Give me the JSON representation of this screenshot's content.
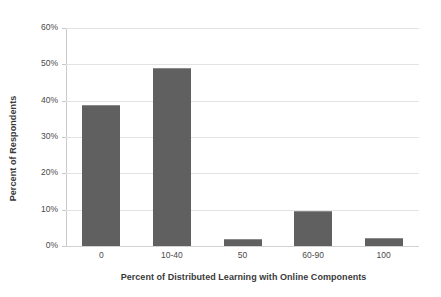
{
  "chart_data": {
    "type": "bar",
    "title": "",
    "categories": [
      "0",
      "10-40",
      "50",
      "60-90",
      "100"
    ],
    "values": [
      38.8,
      49.0,
      2.0,
      9.7,
      2.3
    ],
    "xlabel": "Percent of Distributed Learning with Online Components",
    "ylabel": "Percent of Respondents",
    "ylim": [
      0,
      60
    ],
    "ytick_labels": [
      "0%",
      "10%",
      "20%",
      "30%",
      "40%",
      "50%",
      "60%"
    ],
    "ytick_values": [
      0,
      10,
      20,
      30,
      40,
      50,
      60
    ],
    "grid": true,
    "legend": false,
    "bar_color": "#606060",
    "gridline_color": "#e3e3e3",
    "axis_color": "#c9c9c9",
    "background_color": "#ffffff",
    "text_color": "#3a3a3a"
  }
}
